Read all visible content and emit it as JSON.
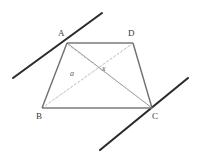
{
  "figure": {
    "canvas": {
      "width": 197,
      "height": 160,
      "background": "#ffffff"
    },
    "colors": {
      "transversal_line": "#2b2b2b",
      "trapezoid_side": "#6f6f6f",
      "diagonal_solid": "#7d7d7d",
      "diagonal_dashed": "#b0b0b0",
      "label_text": "#3a3a3a",
      "angle_text": "#5a5a5a"
    },
    "vertices": [
      {
        "name": "A",
        "label": "A",
        "x": 67,
        "y": 43,
        "label_x": 58,
        "label_y": 29
      },
      {
        "name": "D",
        "label": "D",
        "x": 133,
        "y": 43,
        "label_x": 128,
        "label_y": 29
      },
      {
        "name": "B",
        "label": "B",
        "x": 42,
        "y": 108,
        "label_x": 36,
        "label_y": 112
      },
      {
        "name": "C",
        "label": "C",
        "x": 152,
        "y": 108,
        "label_x": 152,
        "label_y": 112
      }
    ],
    "sides": [
      {
        "name": "side-AD",
        "from": "A",
        "to": "D",
        "x1": 67,
        "y1": 43,
        "x2": 133,
        "y2": 43,
        "style": "solid"
      },
      {
        "name": "side-AB",
        "from": "A",
        "to": "B",
        "x1": 67,
        "y1": 43,
        "x2": 42,
        "y2": 108,
        "style": "solid"
      },
      {
        "name": "side-BC",
        "from": "B",
        "to": "C",
        "x1": 42,
        "y1": 108,
        "x2": 152,
        "y2": 108,
        "style": "solid"
      },
      {
        "name": "side-DC",
        "from": "D",
        "to": "C",
        "x1": 133,
        "y1": 43,
        "x2": 152,
        "y2": 108,
        "style": "solid"
      }
    ],
    "diagonals": [
      {
        "name": "diagonal-AC",
        "from": "A",
        "to": "C",
        "x1": 67,
        "y1": 43,
        "x2": 152,
        "y2": 108,
        "style": "solid"
      },
      {
        "name": "diagonal-BD",
        "from": "B",
        "to": "D",
        "x1": 42,
        "y1": 108,
        "x2": 133,
        "y2": 43,
        "style": "dashed"
      }
    ],
    "transversals": [
      {
        "name": "transversal-through-A",
        "x1": 13,
        "y1": 78,
        "x2": 102,
        "y2": 13
      },
      {
        "name": "transversal-through-C",
        "x1": 100,
        "y1": 150,
        "x2": 188,
        "y2": 78
      }
    ],
    "angle_marks": [
      {
        "name": "angle-a",
        "label": "a",
        "x": 70,
        "y": 70
      },
      {
        "name": "angle-x",
        "label": "x",
        "x": 102,
        "y": 65
      }
    ]
  }
}
